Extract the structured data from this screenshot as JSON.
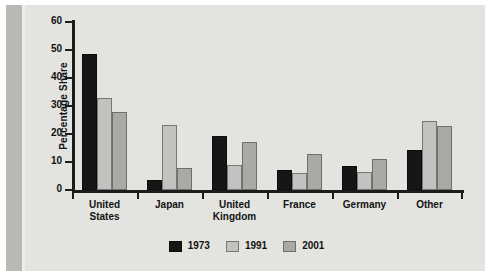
{
  "chart_data": {
    "type": "bar",
    "title": "",
    "subtitle": "",
    "xlabel": "",
    "ylabel": "Percentage Share",
    "ylim": [
      0,
      60
    ],
    "yticks": [
      0,
      10,
      20,
      30,
      40,
      50,
      60
    ],
    "grid": false,
    "legend_position": "bottom",
    "categories": [
      "United States",
      "Japan",
      "United Kingdom",
      "France",
      "Germany",
      "Other"
    ],
    "category_lines": [
      [
        "United",
        "States"
      ],
      [
        "Japan"
      ],
      [
        "United",
        "Kingdom"
      ],
      [
        "France"
      ],
      [
        "Germany"
      ],
      [
        "Other"
      ]
    ],
    "series": [
      {
        "name": "1973",
        "color": "#161616",
        "values": [
          48.5,
          3.5,
          19.3,
          7.0,
          8.5,
          14.3
        ]
      },
      {
        "name": "1991",
        "color": "#c2c2c0",
        "values": [
          32.7,
          23.3,
          8.8,
          6.0,
          6.3,
          24.8
        ]
      },
      {
        "name": "2001",
        "color": "#a9a9a6",
        "values": [
          27.7,
          8.0,
          17.0,
          13.0,
          11.0,
          23.0
        ]
      }
    ]
  },
  "colors": {
    "plate_background": "#e3e3e0",
    "left_band": "#b9b9b6",
    "axis": "#1c1c1c",
    "text": "#121212"
  }
}
